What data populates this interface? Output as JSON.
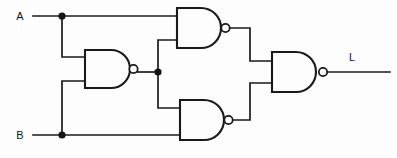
{
  "diagram": {
    "type": "logic-circuit-schematic",
    "background_color": "#fdfdfd",
    "line_color": "#1a1a1a",
    "inputs": [
      {
        "id": "A",
        "label": "A",
        "x": 20,
        "y": 16
      },
      {
        "id": "B",
        "label": "B",
        "x": 20,
        "y": 135
      }
    ],
    "outputs": [
      {
        "id": "L",
        "label": "L",
        "x": 352,
        "y": 57
      }
    ],
    "gates": [
      {
        "id": "G1",
        "type": "NAND",
        "inputs": [
          "A",
          "G2"
        ],
        "output": "G1",
        "x": 177,
        "y": 8,
        "w": 48,
        "h": 40
      },
      {
        "id": "G2",
        "type": "NAND",
        "inputs": [
          "A",
          "B"
        ],
        "output": "G2",
        "x": 85,
        "y": 50,
        "w": 45,
        "h": 38
      },
      {
        "id": "G3",
        "type": "NAND",
        "inputs": [
          "G2",
          "B"
        ],
        "output": "G3",
        "x": 180,
        "y": 100,
        "w": 45,
        "h": 40
      },
      {
        "id": "G4",
        "type": "NAND",
        "inputs": [
          "G1",
          "G3"
        ],
        "output": "L",
        "x": 272,
        "y": 52,
        "w": 48,
        "h": 40
      }
    ],
    "junctions": [
      {
        "id": "J-A",
        "on": "A",
        "x": 62,
        "y": 16
      },
      {
        "id": "J-B",
        "on": "B",
        "x": 62,
        "y": 135
      },
      {
        "id": "J-G2",
        "on": "G2",
        "x": 158,
        "y": 72
      }
    ],
    "gate_count": 4,
    "function": "XOR"
  }
}
